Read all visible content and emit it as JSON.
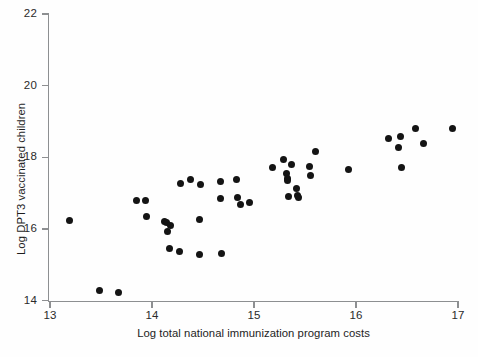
{
  "chart_data": {
    "type": "scatter",
    "title": "",
    "xlabel": "Log total national immunization program costs",
    "ylabel": "Log DPT3 vaccinated children",
    "xlim": [
      12.92,
      17.08
    ],
    "ylim": [
      13.8,
      22.15
    ],
    "xticks": [
      13,
      14,
      15,
      16,
      17
    ],
    "yticks": [
      14,
      16,
      18,
      20,
      22
    ],
    "xtick_labels": [
      "13",
      "14",
      "15",
      "16",
      "17"
    ],
    "ytick_labels": [
      "14",
      "16",
      "18",
      "20",
      "22"
    ],
    "grid": false,
    "legend": null,
    "marker": {
      "shape": "circle",
      "color": "#141414",
      "size_px": 7
    },
    "n_points": 51,
    "points": [
      {
        "x": 13.19,
        "y": 16.22
      },
      {
        "x": 13.49,
        "y": 14.28
      },
      {
        "x": 13.67,
        "y": 14.21
      },
      {
        "x": 13.85,
        "y": 16.79
      },
      {
        "x": 13.94,
        "y": 16.79
      },
      {
        "x": 13.95,
        "y": 16.35
      },
      {
        "x": 14.12,
        "y": 16.21
      },
      {
        "x": 14.14,
        "y": 16.18
      },
      {
        "x": 14.15,
        "y": 15.92
      },
      {
        "x": 14.18,
        "y": 16.09
      },
      {
        "x": 14.17,
        "y": 15.44
      },
      {
        "x": 14.27,
        "y": 15.38
      },
      {
        "x": 14.28,
        "y": 17.27
      },
      {
        "x": 14.38,
        "y": 17.37
      },
      {
        "x": 14.48,
        "y": 17.25
      },
      {
        "x": 14.47,
        "y": 16.25
      },
      {
        "x": 14.47,
        "y": 15.29
      },
      {
        "x": 14.67,
        "y": 17.31
      },
      {
        "x": 14.67,
        "y": 16.86
      },
      {
        "x": 14.68,
        "y": 15.32
      },
      {
        "x": 14.83,
        "y": 17.38
      },
      {
        "x": 14.84,
        "y": 16.89
      },
      {
        "x": 14.87,
        "y": 16.67
      },
      {
        "x": 14.96,
        "y": 16.75
      },
      {
        "x": 15.18,
        "y": 17.72
      },
      {
        "x": 15.29,
        "y": 17.95
      },
      {
        "x": 15.32,
        "y": 17.55
      },
      {
        "x": 15.33,
        "y": 17.4
      },
      {
        "x": 15.33,
        "y": 17.34
      },
      {
        "x": 15.34,
        "y": 16.9
      },
      {
        "x": 15.37,
        "y": 17.79
      },
      {
        "x": 15.42,
        "y": 17.12
      },
      {
        "x": 15.43,
        "y": 16.92
      },
      {
        "x": 15.44,
        "y": 16.88
      },
      {
        "x": 15.54,
        "y": 17.73
      },
      {
        "x": 15.55,
        "y": 17.5
      },
      {
        "x": 15.6,
        "y": 18.16
      },
      {
        "x": 15.93,
        "y": 17.67
      },
      {
        "x": 16.32,
        "y": 18.53
      },
      {
        "x": 16.44,
        "y": 18.59
      },
      {
        "x": 16.42,
        "y": 18.26
      },
      {
        "x": 16.45,
        "y": 17.7
      },
      {
        "x": 16.58,
        "y": 18.8
      },
      {
        "x": 16.66,
        "y": 18.37
      },
      {
        "x": 16.95,
        "y": 18.8
      }
    ]
  }
}
